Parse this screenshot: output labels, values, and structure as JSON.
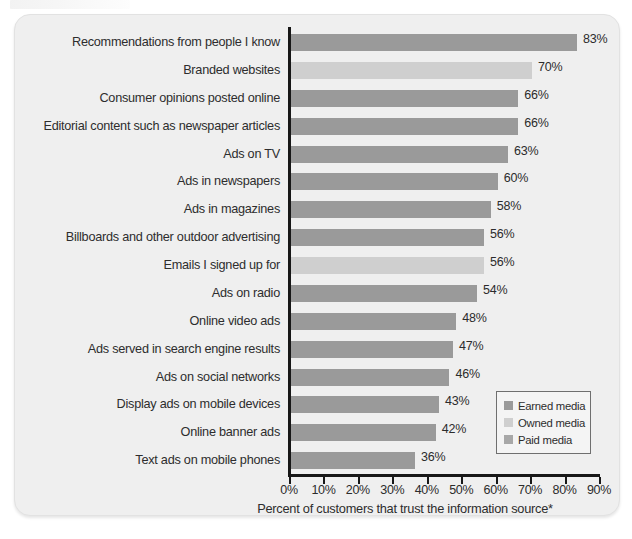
{
  "figure": {
    "top_fragment_note": "",
    "panel_background": "#efefef"
  },
  "chart_data": {
    "type": "bar",
    "orientation": "horizontal",
    "title": "",
    "xlabel": "Percent of customers that trust the information source*",
    "ylabel": "",
    "xlim": [
      0,
      90
    ],
    "xtick_labels": [
      "0%",
      "10%",
      "20%",
      "30%",
      "40%",
      "50%",
      "60%",
      "70%",
      "80%",
      "90%"
    ],
    "xtick_values": [
      0,
      10,
      20,
      30,
      40,
      50,
      60,
      70,
      80,
      90
    ],
    "grid": false,
    "legend_position": "bottom-right",
    "categories": [
      "Recommendations from people I know",
      "Branded websites",
      "Consumer opinions posted online",
      "Editorial content such as newspaper articles",
      "Ads on TV",
      "Ads in newspapers",
      "Ads in magazines",
      "Billboards and other outdoor advertising",
      "Emails I signed up for",
      "Ads on radio",
      "Online video ads",
      "Ads served in search engine results",
      "Ads on social networks",
      "Display ads on mobile devices",
      "Online banner ads",
      "Text ads on mobile phones"
    ],
    "values": [
      83,
      70,
      66,
      66,
      63,
      60,
      58,
      56,
      56,
      54,
      48,
      47,
      46,
      43,
      42,
      36
    ],
    "value_labels": [
      "83%",
      "70%",
      "66%",
      "66%",
      "63%",
      "60%",
      "58%",
      "56%",
      "56%",
      "54%",
      "48%",
      "47%",
      "46%",
      "43%",
      "42%",
      "36%"
    ],
    "series_by_bar": [
      "earned",
      "owned",
      "earned",
      "earned",
      "paid",
      "paid",
      "paid",
      "paid",
      "owned",
      "paid",
      "paid",
      "paid",
      "paid",
      "paid",
      "paid",
      "paid"
    ],
    "legend": [
      {
        "key": "earned",
        "label": "Earned media",
        "color": "#9a9a9a"
      },
      {
        "key": "owned",
        "label": "Owned media",
        "color": "#cfcfcf"
      },
      {
        "key": "paid",
        "label": "Paid media",
        "color": "#a8a8a8"
      }
    ]
  }
}
